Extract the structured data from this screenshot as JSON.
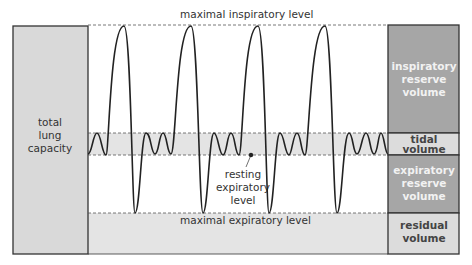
{
  "diagram": {
    "levels": {
      "max_inspiratory": "maximal inspiratory level",
      "max_expiratory": "maximal expiratory level",
      "resting_expiratory": [
        "resting",
        "expiratory",
        "level"
      ]
    },
    "left_box": {
      "label": [
        "total",
        "lung",
        "capacity"
      ],
      "color": "#d9d9d9"
    },
    "right_boxes": [
      {
        "id": "irv",
        "label": [
          "inspiratory",
          "reserve",
          "volume"
        ],
        "color": "#a6a6a6",
        "text_color": "#f2f2f2"
      },
      {
        "id": "tv",
        "label": [
          "tidal",
          "volume"
        ],
        "color": "#dcdcdc",
        "text_color": "#444444"
      },
      {
        "id": "erv",
        "label": [
          "expiratory",
          "reserve",
          "volume"
        ],
        "color": "#a6a6a6",
        "text_color": "#f2f2f2"
      },
      {
        "id": "rv",
        "label": [
          "residual",
          "volume"
        ],
        "color": "#dcdcdc",
        "text_color": "#444444"
      }
    ],
    "colors": {
      "band": "#e4e4e4",
      "line": "#222222",
      "dash": "#555555"
    }
  }
}
